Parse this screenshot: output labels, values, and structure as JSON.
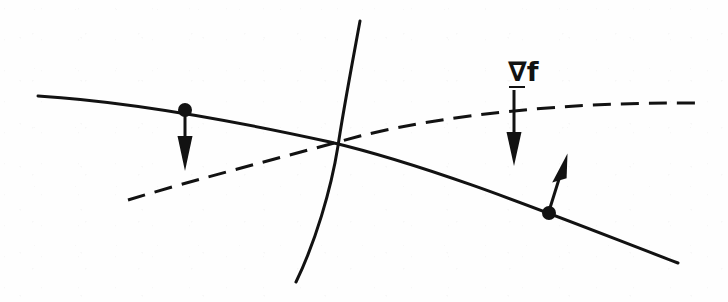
{
  "figure": {
    "type": "line-diagram",
    "width": 728,
    "height": 302,
    "background_color": "#fefefe",
    "ink_color": "#121212",
    "annotations": [
      {
        "id": "gradient-label",
        "text": "∇f",
        "nabla": "∇",
        "function_symbol": "f",
        "underlined": true,
        "x": 508,
        "y": 58,
        "font_size": 27
      }
    ]
  },
  "curves": [
    {
      "name": "constraint-curve-solid",
      "style": "solid",
      "stroke_width": 3.0,
      "description": "gently descending solid curve running left to right",
      "path": "M 38 96 C 120 101, 230 120, 330 142 C 440 168, 570 222, 678 263"
    },
    {
      "name": "objective-contour-dashed",
      "style": "dashed",
      "stroke_width": 3.0,
      "dash_pattern": "18 10",
      "description": "ascending dashed curve running lower-left to right",
      "path": "M 128 200 C 200 178, 280 158, 360 136 C 450 114, 570 102, 695 103"
    },
    {
      "name": "vertical-curve-solid",
      "style": "solid",
      "stroke_width": 3.0,
      "description": "steep solid curve sweeping from top to bottom-left crossing the other curves",
      "path": "M 360 21 C 351 70, 343 112, 338 146 C 331 190, 315 243, 296 282"
    }
  ],
  "points": [
    {
      "name": "point-left",
      "x": 185,
      "y": 110,
      "radius": 7,
      "on_curve": "constraint-curve-solid"
    },
    {
      "name": "point-right",
      "x": 549,
      "y": 213,
      "radius": 7,
      "on_curve": "constraint-curve-solid"
    }
  ],
  "vectors": [
    {
      "name": "gradient-vector-left",
      "direction": "down",
      "from_x": 185,
      "from_y": 112,
      "to_x": 185,
      "to_y": 170,
      "shaft_width": 3,
      "head_length": 34,
      "head_width": 15,
      "anchored_at": "point-left"
    },
    {
      "name": "gradient-vector-labeled",
      "direction": "down",
      "from_x": 514,
      "from_y": 90,
      "to_x": 514,
      "to_y": 165,
      "shaft_width": 3,
      "head_length": 32,
      "head_width": 15,
      "anchored_at": "gradient-label"
    },
    {
      "name": "gradient-vector-right",
      "direction": "up-right",
      "from_x": 549,
      "from_y": 211,
      "to_x": 566,
      "to_y": 154,
      "shaft_width": 3,
      "head_length": 32,
      "head_width": 14,
      "anchored_at": "point-right"
    }
  ],
  "intersection": {
    "name": "curve-intersection",
    "x": 339,
    "y": 145
  }
}
